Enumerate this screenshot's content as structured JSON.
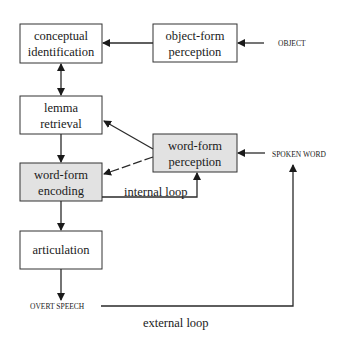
{
  "diagram": {
    "boxes": {
      "conceptual_identification": {
        "line1": "conceptual",
        "line2": "identification",
        "shaded": false
      },
      "object_form_perception": {
        "line1": "object-form",
        "line2": "perception",
        "shaded": false
      },
      "lemma_retrieval": {
        "line1": "lemma",
        "line2": "retrieval",
        "shaded": false
      },
      "word_form_perception": {
        "line1": "word-form",
        "line2": "perception",
        "shaded": true
      },
      "word_form_encoding": {
        "line1": "word-form",
        "line2": "encoding",
        "shaded": true
      },
      "articulation": {
        "line1": "articulation",
        "shaded": false
      }
    },
    "inputs": {
      "object": "OBJECT",
      "spoken_word": "SPOKEN WORD"
    },
    "output": {
      "overt_speech": "OVERT SPEECH"
    },
    "loops": {
      "internal": "internal loop",
      "external": "external loop"
    },
    "colors": {
      "shaded_box": "#e2e2e2",
      "line": "#2a2a2a"
    }
  }
}
